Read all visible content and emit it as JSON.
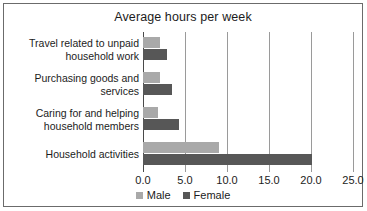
{
  "chart_data": {
    "type": "bar",
    "orientation": "horizontal",
    "title": "Average hours per week",
    "xlabel": "",
    "ylabel": "",
    "xlim": [
      0.0,
      25.0
    ],
    "xticks": [
      "0.0",
      "5.0",
      "10.0",
      "15.0",
      "20.0",
      "25.0"
    ],
    "xtick_values": [
      0.0,
      5.0,
      10.0,
      15.0,
      20.0,
      25.0
    ],
    "grid": true,
    "legend_position": "bottom",
    "categories": [
      "Travel related to unpaid household work",
      "Purchasing goods and services",
      "Caring for and helping household members",
      "Household activities"
    ],
    "category_lines": [
      [
        "Travel related to unpaid",
        "household work"
      ],
      [
        "Purchasing goods and",
        "services"
      ],
      [
        "Caring for and helping",
        "household members"
      ],
      [
        "Household activities"
      ]
    ],
    "series": [
      {
        "name": "Male",
        "color": "#a9a9a9",
        "values": [
          2.0,
          2.0,
          1.8,
          9.0
        ]
      },
      {
        "name": "Female",
        "color": "#575757",
        "values": [
          2.8,
          3.5,
          4.3,
          20.1
        ]
      }
    ]
  },
  "legend": {
    "entries": [
      {
        "label": "Male",
        "color": "#a9a9a9"
      },
      {
        "label": "Female",
        "color": "#575757"
      }
    ]
  },
  "colors": {
    "male": "#a9a9a9",
    "female": "#575757",
    "gridline": "#9a9a9a",
    "axis": "#4a4a4a",
    "border": "#6b6b6b",
    "text": "#1c1c1c"
  }
}
